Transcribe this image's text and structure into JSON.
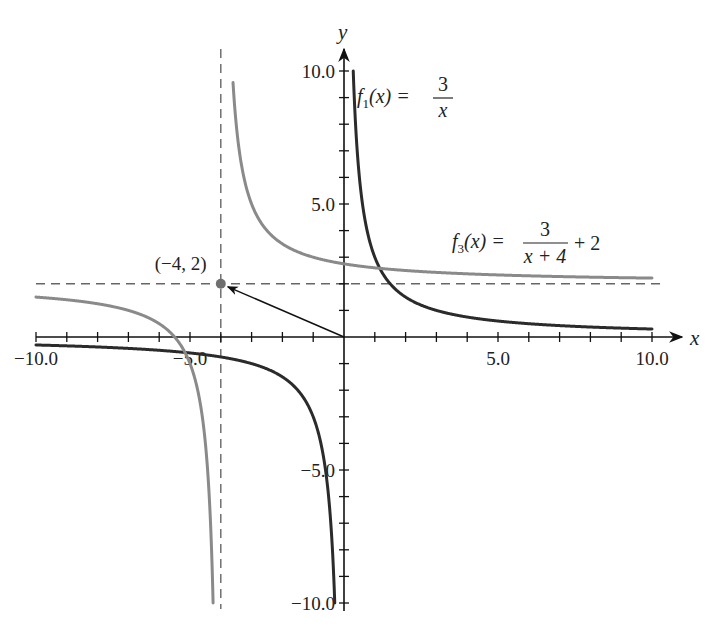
{
  "chart_data": {
    "type": "line",
    "title": "",
    "xlabel": "x",
    "ylabel": "y",
    "xlim": [
      -10,
      10
    ],
    "ylim": [
      -10,
      10
    ],
    "grid": false,
    "x_ticks": {
      "major_step": 1,
      "labels": [
        {
          "value": -10,
          "text": "−10.0"
        },
        {
          "value": -5,
          "text": "−5.0"
        },
        {
          "value": 5,
          "text": "5.0"
        },
        {
          "value": 10,
          "text": "10.0"
        }
      ]
    },
    "y_ticks": {
      "major_step": 1,
      "labels": [
        {
          "value": 10,
          "text": "10.0"
        },
        {
          "value": 5,
          "text": "5.0"
        },
        {
          "value": -5,
          "text": "−5.0"
        },
        {
          "value": -10,
          "text": "−10.0"
        }
      ]
    },
    "series": [
      {
        "name": "f1(x) = 3/x",
        "formula": "3/x",
        "color": "#2b2b2b",
        "vertical_asymptote": 0,
        "horizontal_asymptote": 0,
        "sample_points": [
          [
            -10,
            -0.3
          ],
          [
            -5,
            -0.6
          ],
          [
            -3,
            -1
          ],
          [
            -1,
            -3
          ],
          [
            -0.5,
            -6
          ],
          [
            -0.3,
            -10
          ],
          [
            0.3,
            10
          ],
          [
            0.5,
            6
          ],
          [
            1,
            3
          ],
          [
            3,
            1
          ],
          [
            5,
            0.6
          ],
          [
            10,
            0.3
          ]
        ]
      },
      {
        "name": "f3(x) = 3/(x+4) + 2",
        "formula": "3/(x+4)+2",
        "color": "#8a8a8a",
        "vertical_asymptote": -4,
        "horizontal_asymptote": 2,
        "sample_points": [
          [
            -10,
            1.5
          ],
          [
            -6,
            0.5
          ],
          [
            -5,
            -1
          ],
          [
            -4.5,
            -4
          ],
          [
            -4.375,
            -6
          ],
          [
            -4.25,
            -10
          ],
          [
            -3.625,
            10
          ],
          [
            -3,
            5
          ],
          [
            -2,
            3.5
          ],
          [
            0,
            2.75
          ],
          [
            2,
            2.5
          ],
          [
            5,
            2.33
          ],
          [
            10,
            2.21
          ]
        ]
      }
    ],
    "asymptote_lines": [
      {
        "type": "vertical",
        "x": -4,
        "style": "dashed"
      },
      {
        "type": "horizontal",
        "y": 2,
        "style": "dashed"
      }
    ],
    "annotations": [
      {
        "type": "point",
        "x": -4,
        "y": 2,
        "label": "(−4, 2)"
      },
      {
        "type": "arrow",
        "from": [
          0,
          0
        ],
        "to": [
          -4,
          2
        ],
        "note": "translation from origin to (-4, 2)"
      }
    ]
  },
  "labels": {
    "x_axis": "x",
    "y_axis": "y",
    "point_label": "(−4, 2)",
    "f1": {
      "name": "f",
      "sub": "1",
      "arg": "(x) =",
      "num": "3",
      "den": "x"
    },
    "f3": {
      "name": "f",
      "sub": "3",
      "arg": "(x) =",
      "num": "3",
      "den": "x + 4",
      "tail": "+ 2"
    }
  }
}
